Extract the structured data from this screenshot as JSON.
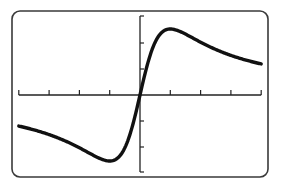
{
  "screen": {
    "background": "#ffffff",
    "frame_color": "#3a3a3a",
    "curve_color": "#111111",
    "axis_color": "#222222"
  },
  "chart_data": {
    "type": "line",
    "title": "",
    "xlabel": "",
    "ylabel": "",
    "function_shape": "y = 2x/(x^2+1)",
    "xlim": [
      -4,
      4
    ],
    "ylim": [
      -2.5,
      2.5
    ],
    "x_ticks": [
      -4,
      -3,
      -2,
      -1,
      0,
      1,
      2,
      3,
      4
    ],
    "y_ticks": [
      -2,
      -1,
      0,
      1,
      2
    ],
    "grid": false,
    "legend": null,
    "series": [
      {
        "name": "curve",
        "x": [
          -4,
          -3.5,
          -3,
          -2.5,
          -2,
          -1.5,
          -1,
          -0.75,
          -0.5,
          -0.25,
          0,
          0.25,
          0.5,
          0.75,
          1,
          1.5,
          2,
          2.5,
          3,
          3.5,
          4
        ],
        "values": [
          -0.47,
          -0.53,
          -0.6,
          -0.69,
          -0.8,
          -0.92,
          -1.0,
          -0.96,
          -0.8,
          -0.47,
          0,
          0.47,
          0.8,
          0.96,
          1.0,
          0.92,
          0.8,
          0.69,
          0.6,
          0.53,
          0.47
        ]
      }
    ],
    "annotations": {
      "max_point": [
        1,
        1.0
      ],
      "min_point": [
        -1,
        -1.0
      ]
    }
  }
}
